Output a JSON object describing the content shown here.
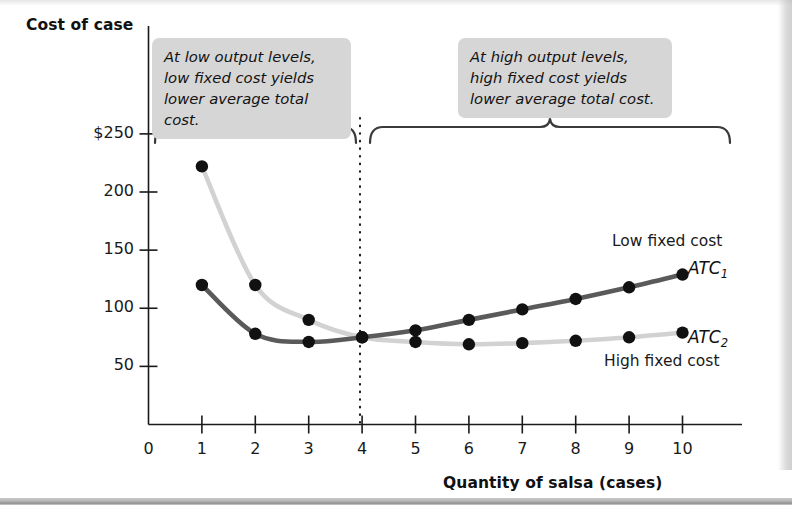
{
  "figure": {
    "y_axis_title": "Cost of case",
    "x_axis_title": "Quantity of salsa (cases)"
  },
  "annotations": {
    "left_callout": "At low output levels,\nlow fixed cost yields\nlower average total cost.",
    "right_callout": "At high output levels,\nhigh fixed cost yields\nlower average total cost."
  },
  "series_labels": {
    "atc1": "ATC",
    "atc1_sub": "1",
    "atc2": "ATC",
    "atc2_sub": "2",
    "low_fixed_cost": "Low fixed cost",
    "high_fixed_cost": "High fixed cost"
  },
  "ticks": {
    "y": [
      "$250",
      "200",
      "150",
      "100",
      "50"
    ],
    "x": [
      "0",
      "1",
      "2",
      "3",
      "4",
      "5",
      "6",
      "7",
      "8",
      "9",
      "10"
    ]
  },
  "colors": {
    "atc1_line": "#5a5a5a",
    "atc2_line": "#d2d2d2",
    "point": "#111111",
    "axis": "#1a1a1a",
    "callout_bg": "#d6d6d6",
    "bracket": "#3a3a3a"
  },
  "chart_data": {
    "type": "line",
    "title": "",
    "xlabel": "Quantity of salsa (cases)",
    "ylabel": "Cost of case",
    "xlim": [
      0,
      10.6
    ],
    "ylim": [
      0,
      260
    ],
    "xticks": [
      0,
      1,
      2,
      3,
      4,
      5,
      6,
      7,
      8,
      9,
      10
    ],
    "yticks": [
      50,
      100,
      150,
      200,
      250
    ],
    "ytick_labels": [
      "50",
      "100",
      "150",
      "200",
      "$250"
    ],
    "grid": false,
    "legend": "inline labels at right end of each curve",
    "x": [
      1,
      2,
      3,
      4,
      5,
      6,
      7,
      8,
      9,
      10
    ],
    "series": [
      {
        "name": "ATC1",
        "description": "Low fixed cost",
        "color": "#5a5a5a",
        "values": [
          120,
          78,
          71,
          75,
          81,
          90,
          99,
          108,
          118,
          129
        ]
      },
      {
        "name": "ATC2",
        "description": "High fixed cost",
        "color": "#d2d2d2",
        "values": [
          222,
          120,
          90,
          75,
          71,
          69,
          70,
          72,
          75,
          79
        ]
      }
    ],
    "annotations": [
      {
        "text": "At low output levels, low fixed cost yields lower average total cost.",
        "x_range": [
          0.15,
          3.9
        ]
      },
      {
        "text": "At high output levels, high fixed cost yields lower average total cost.",
        "x_range": [
          4.1,
          10.5
        ]
      }
    ],
    "crossover_point": {
      "x": 4,
      "y": 75
    },
    "divider_line": {
      "x": 4,
      "style": "dotted"
    }
  }
}
